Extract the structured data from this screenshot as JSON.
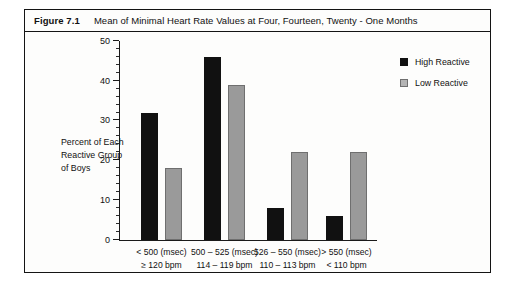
{
  "figure": {
    "number": "Figure 7.1",
    "title": "Mean of Minimal Heart Rate Values at Four, Fourteen, Twenty - One Months"
  },
  "y_axis_title": {
    "line1": "Percent of Each",
    "line2": "Reactive Group",
    "line3": "of Boys"
  },
  "legend": {
    "items": [
      {
        "label": "High Reactive",
        "color": "#111111"
      },
      {
        "label": "Low Reactive",
        "color": "#b4b4b4"
      }
    ]
  },
  "colors": {
    "high_reactive": "#111111",
    "low_reactive": "#9a9a9a",
    "frame": "#141414",
    "background": "#fdfdfc"
  },
  "chart_data": {
    "type": "bar",
    "title": "Mean of Minimal Heart Rate Values at Four, Fourteen, Twenty - One Months",
    "xlabel": "",
    "ylabel": "Percent of Each Reactive Group of Boys",
    "ylim": [
      0,
      50
    ],
    "yticks": [
      0,
      10,
      20,
      30,
      40,
      50
    ],
    "ytick_labels": [
      "0",
      "10",
      "20",
      "30",
      "40",
      "50"
    ],
    "minor_tick_step": 2,
    "grid": false,
    "legend_position": "right",
    "categories": [
      "< 500 (msec)",
      "500 – 525 (msec)",
      "526 – 550 (msec)",
      "> 550 (msec)"
    ],
    "category_sublabels": [
      "≥ 120 bpm",
      "114 – 119 bpm",
      "110 – 113 bpm",
      "< 110 bpm"
    ],
    "series": [
      {
        "name": "High Reactive",
        "color": "#111111",
        "values": [
          32,
          46,
          8,
          6
        ]
      },
      {
        "name": "Low Reactive",
        "color": "#9a9a9a",
        "values": [
          18,
          39,
          22,
          22
        ]
      }
    ]
  }
}
